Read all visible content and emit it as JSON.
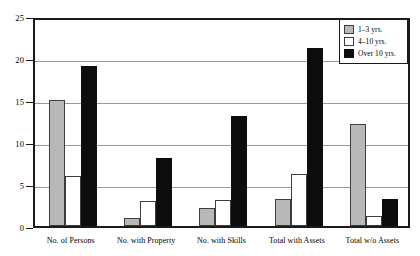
{
  "chart_data": {
    "type": "bar",
    "title": "",
    "subtitle": "",
    "xlabel": "",
    "ylabel": "",
    "ylim": [
      0,
      25
    ],
    "yticks": [
      0,
      5,
      10,
      15,
      20,
      25
    ],
    "ytick_labels": [
      "0",
      "5",
      "10",
      "15",
      "20",
      "25"
    ],
    "grid": true,
    "grid_axis": "y",
    "legend_position": "top-right",
    "categories": [
      "No. of Persons",
      "No. with Property",
      "No. with Skills",
      "Total with Assets",
      "Total w/o Assets"
    ],
    "series": [
      {
        "name": "1–3 yrs.",
        "color": "#b8b8b8",
        "values": [
          15.0,
          1.0,
          2.1,
          3.2,
          12.2
        ]
      },
      {
        "name": "4–10 yrs.",
        "color": "#ffffff",
        "values": [
          6.0,
          3.0,
          3.1,
          6.2,
          1.2
        ]
      },
      {
        "name": "Over 10 yrs.",
        "color": "#0d0d0d",
        "values": [
          19.1,
          8.1,
          13.1,
          21.2,
          3.2
        ]
      }
    ]
  },
  "legend": {
    "entries": [
      {
        "label": "1–3 yrs."
      },
      {
        "label": "4–10 yrs."
      },
      {
        "label": "Over 10 yrs."
      }
    ]
  },
  "axes": {
    "y": {
      "labels": [
        "25",
        "20",
        "15",
        "10",
        "5",
        "0"
      ],
      "values": [
        25,
        20,
        15,
        10,
        5,
        0
      ]
    },
    "x": {
      "labels": [
        "No. of Persons",
        "No. with Property",
        "No. with Skills",
        "Total with Assets",
        "Total w/o Assets"
      ]
    }
  },
  "colors": {
    "series_1_3": "#b8b8b8",
    "series_4_10": "#ffffff",
    "series_over_10": "#0d0d0d",
    "axis": "#1a1a1a",
    "gridline": "#9a9a9a",
    "background": "#ffffff"
  }
}
